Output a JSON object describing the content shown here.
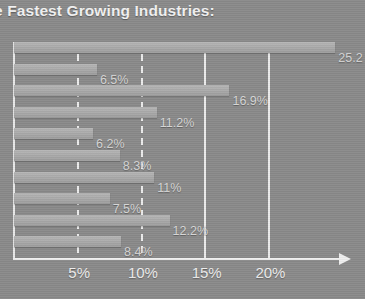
{
  "chart_data": {
    "type": "bar",
    "orientation": "horizontal",
    "title": "e Fastest Growing Industries:",
    "xlabel": "",
    "ylabel": "",
    "xlim": [
      0,
      26
    ],
    "grid": true,
    "legend": null,
    "categories": [
      "1",
      "2",
      "3",
      "4",
      "5",
      "6",
      "7",
      "8",
      "9",
      "10"
    ],
    "values": [
      25.2,
      6.5,
      16.9,
      11.2,
      6.2,
      8.3,
      11,
      7.5,
      12.2,
      8.4
    ],
    "data_labels": [
      "25.2",
      "6.5%",
      "16.9%",
      "11.2%",
      "6.2%",
      "8.3%",
      "11%",
      "7.5%",
      "12.2%",
      "8.4%"
    ],
    "tick_labels": [
      "5%",
      "10%",
      "15%",
      "20%"
    ],
    "tick_values": [
      5,
      10,
      15,
      20
    ],
    "colors": {
      "background": "#8a8a8a",
      "bar": "#ababab",
      "grid": "#ececec",
      "axis": "#efefef",
      "title_text": "#f2f2f2",
      "label_text": "#d6d6d6",
      "tick_text": "#ededed"
    }
  },
  "header": {
    "title": "e Fastest Growing Industries:"
  },
  "axis": {
    "ticks": [
      {
        "label": "5%",
        "value": 5,
        "style": "dashed"
      },
      {
        "label": "10%",
        "value": 10,
        "style": "dashed"
      },
      {
        "label": "15%",
        "value": 15,
        "style": "solid"
      },
      {
        "label": "20%",
        "value": 20,
        "style": "solid"
      }
    ]
  },
  "bars": [
    {
      "label": "25.2",
      "value": 25.2
    },
    {
      "label": "6.5%",
      "value": 6.5
    },
    {
      "label": "16.9%",
      "value": 16.9
    },
    {
      "label": "11.2%",
      "value": 11.2
    },
    {
      "label": "6.2%",
      "value": 6.2
    },
    {
      "label": "8.3%",
      "value": 8.3
    },
    {
      "label": "11%",
      "value": 11
    },
    {
      "label": "7.5%",
      "value": 7.5
    },
    {
      "label": "12.2%",
      "value": 12.2
    },
    {
      "label": "8.4%",
      "value": 8.4
    }
  ]
}
